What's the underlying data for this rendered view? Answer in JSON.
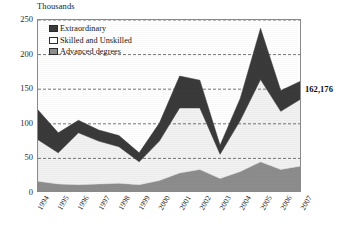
{
  "chart_data": {
    "type": "area",
    "stacked": true,
    "title": "Thousands",
    "xlabel": "",
    "ylabel": "Thousands",
    "ylim": [
      0,
      250
    ],
    "yticks": [
      0,
      50,
      100,
      150,
      200,
      250
    ],
    "grid": true,
    "grid_axis": "y",
    "legend_position": "top-left",
    "categories": [
      "1994",
      "1995",
      "1996",
      "1997",
      "1998",
      "1999",
      "2000",
      "2001",
      "2002",
      "2003",
      "2004",
      "2005",
      "2006",
      "2007"
    ],
    "series": [
      {
        "name": "Advanced degrees",
        "color": "#8d8d8d",
        "values": [
          17,
          13,
          12,
          13,
          14,
          12,
          18,
          29,
          34,
          21,
          31,
          45,
          34,
          39
        ]
      },
      {
        "name": "Skilled and Unskilled",
        "color": "#f2f2f2",
        "values": [
          60,
          45,
          75,
          62,
          53,
          33,
          57,
          94,
          89,
          35,
          74,
          119,
          84,
          97
        ]
      },
      {
        "name": "Extraordinary",
        "color": "#3a3a3a",
        "values": [
          43,
          29,
          18,
          16,
          16,
          13,
          26,
          46,
          40,
          13,
          32,
          74,
          30,
          26
        ]
      }
    ],
    "totals": [
      120,
      87,
      105,
      91,
      83,
      58,
      101,
      169,
      163,
      69,
      137,
      238,
      148,
      162
    ],
    "annotations": [
      {
        "text": "162,176",
        "series": "total",
        "category": "2007"
      }
    ]
  },
  "legend": {
    "items": [
      {
        "label": "Extraordinary",
        "swatch": "extra"
      },
      {
        "label": "Skilled and Unskilled",
        "swatch": "skilled"
      },
      {
        "label": "Advanced degrees",
        "swatch": "adv"
      }
    ]
  }
}
